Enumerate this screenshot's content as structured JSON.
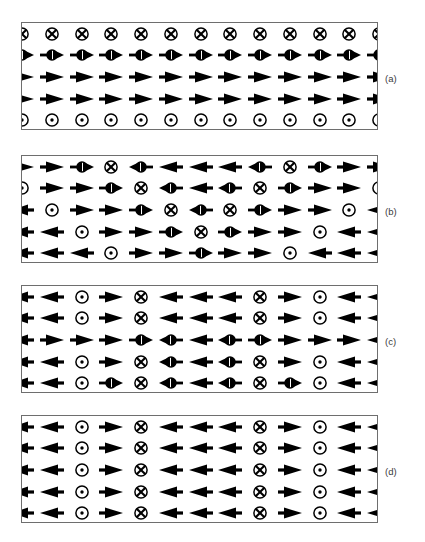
{
  "figure": {
    "type": "spin-configuration-diagram",
    "panel_count": 4,
    "columns": 13,
    "rows_per_panel": 5,
    "colors": {
      "symbol": "#000000",
      "frame": "#6e6e6e",
      "background": "#ffffff",
      "label": "#3a3a3a"
    },
    "symbol_legend": {
      "right": "arrow-right-icon",
      "left": "arrow-left-icon",
      "into": "cross-in-circle-icon",
      "out": "dot-in-circle-icon",
      "tilt_right": "half-circle-arrow-right-icon",
      "tilt_left": "half-circle-arrow-left-icon"
    },
    "panels": [
      {
        "label": "(a)",
        "name": "panel-a",
        "rows": [
          [
            "into",
            "into",
            "into",
            "into",
            "into",
            "into",
            "into",
            "into",
            "into",
            "into",
            "into",
            "into",
            "into"
          ],
          [
            "tilt_right",
            "tilt_right",
            "tilt_right",
            "tilt_right",
            "tilt_right",
            "tilt_right",
            "tilt_right",
            "tilt_right",
            "tilt_right",
            "tilt_right",
            "tilt_right",
            "tilt_right",
            "tilt_right"
          ],
          [
            "right",
            "right",
            "right",
            "right",
            "right",
            "right",
            "right",
            "right",
            "right",
            "right",
            "right",
            "right",
            "right"
          ],
          [
            "right",
            "right",
            "right",
            "right",
            "right",
            "right",
            "right",
            "right",
            "right",
            "right",
            "right",
            "right",
            "right"
          ],
          [
            "out",
            "out",
            "out",
            "out",
            "out",
            "out",
            "out",
            "out",
            "out",
            "out",
            "out",
            "out",
            "out"
          ]
        ]
      },
      {
        "label": "(b)",
        "name": "panel-b",
        "rows": [
          [
            "right",
            "right",
            "tilt_right",
            "into",
            "tilt_left",
            "left",
            "left",
            "left",
            "tilt_left",
            "into",
            "tilt_right",
            "right",
            "right"
          ],
          [
            "out",
            "right",
            "right",
            "tilt_right",
            "into",
            "tilt_left",
            "left",
            "tilt_left",
            "into",
            "tilt_right",
            "right",
            "right",
            "out"
          ],
          [
            "left",
            "out",
            "right",
            "right",
            "tilt_right",
            "into",
            "tilt_left",
            "into",
            "tilt_right",
            "right",
            "right",
            "out",
            "left"
          ],
          [
            "left",
            "left",
            "out",
            "right",
            "right",
            "tilt_right",
            "into",
            "tilt_right",
            "right",
            "right",
            "out",
            "left",
            "left"
          ],
          [
            "left",
            "left",
            "left",
            "out",
            "right",
            "right",
            "tilt_right",
            "right",
            "right",
            "out",
            "left",
            "left",
            "left"
          ]
        ]
      },
      {
        "label": "(c)",
        "name": "panel-c",
        "rows": [
          [
            "left",
            "left",
            "out",
            "right",
            "into",
            "left",
            "left",
            "left",
            "into",
            "right",
            "out",
            "left",
            "left"
          ],
          [
            "left",
            "left",
            "out",
            "right",
            "into",
            "left",
            "left",
            "left",
            "into",
            "right",
            "out",
            "left",
            "left"
          ],
          [
            "left",
            "right",
            "right",
            "right",
            "tilt_right",
            "tilt_left",
            "left",
            "tilt_left",
            "tilt_right",
            "right",
            "right",
            "right",
            "left"
          ],
          [
            "left",
            "left",
            "out",
            "right",
            "into",
            "tilt_left",
            "left",
            "tilt_left",
            "into",
            "right",
            "out",
            "left",
            "left"
          ],
          [
            "left",
            "left",
            "out",
            "tilt_right",
            "into",
            "tilt_left",
            "left",
            "tilt_left",
            "into",
            "tilt_right",
            "out",
            "left",
            "left"
          ]
        ]
      },
      {
        "label": "(d)",
        "name": "panel-d",
        "rows": [
          [
            "left",
            "left",
            "out",
            "right",
            "into",
            "left",
            "left",
            "left",
            "into",
            "right",
            "out",
            "left",
            "left"
          ],
          [
            "left",
            "left",
            "out",
            "right",
            "into",
            "left",
            "left",
            "left",
            "into",
            "right",
            "out",
            "left",
            "left"
          ],
          [
            "left",
            "left",
            "out",
            "right",
            "into",
            "left",
            "left",
            "left",
            "into",
            "right",
            "out",
            "left",
            "left"
          ],
          [
            "left",
            "left",
            "out",
            "right",
            "into",
            "left",
            "left",
            "left",
            "into",
            "right",
            "out",
            "left",
            "left"
          ],
          [
            "left",
            "left",
            "out",
            "right",
            "into",
            "left",
            "left",
            "left",
            "into",
            "right",
            "out",
            "left",
            "left"
          ]
        ]
      }
    ],
    "geometry": {
      "panel_tops": [
        22,
        155,
        285,
        415
      ],
      "panel_height": 108,
      "label_tops": [
        73,
        206,
        336,
        466
      ]
    }
  }
}
